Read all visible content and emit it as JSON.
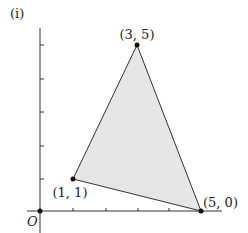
{
  "figure": {
    "part_label": "(i)",
    "origin_label": "O",
    "axes": {
      "x_ticks": [
        1,
        2,
        3,
        4,
        5
      ],
      "y_ticks": [
        1,
        2,
        3,
        4,
        5
      ]
    },
    "triangle": {
      "fill": "#e6e6e6",
      "stroke": "#333333",
      "vertices": [
        {
          "x": 1,
          "y": 1,
          "label": "(1, 1)"
        },
        {
          "x": 3,
          "y": 5,
          "label": "(3, 5)"
        },
        {
          "x": 5,
          "y": 0,
          "label": "(5, 0)"
        }
      ]
    }
  }
}
